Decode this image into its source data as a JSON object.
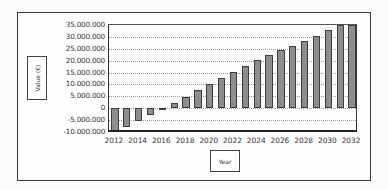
{
  "chart_data": {
    "type": "bar",
    "title": "",
    "xlabel": "Year",
    "ylabel": "Value (€)",
    "ylim": [
      -10000000,
      35000000
    ],
    "y_ticks": [
      "35.000.000",
      "30.000.000",
      "25.000.000",
      "20.000.000",
      "15.000.000",
      "10.000.000",
      "5.000.000",
      "0",
      "-5.000.000",
      "-10.000.000"
    ],
    "x_ticks": [
      "2012",
      "2014",
      "2016",
      "2018",
      "2020",
      "2022",
      "2024",
      "2026",
      "2028",
      "2030",
      "2032"
    ],
    "grid": true,
    "legend": null,
    "categories": [
      "2012",
      "2013",
      "2014",
      "2015",
      "2016",
      "2017",
      "2018",
      "2019",
      "2020",
      "2021",
      "2022",
      "2023",
      "2024",
      "2025",
      "2026",
      "2027",
      "2028",
      "2029",
      "2030",
      "2031",
      "2032"
    ],
    "values": [
      -10000000,
      -7800000,
      -5200000,
      -2800000,
      -300000,
      2100000,
      4800000,
      7600000,
      10200000,
      12800000,
      15300000,
      17800000,
      20300000,
      22400000,
      24300000,
      26300000,
      28400000,
      30500000,
      33000000,
      35000000,
      36000000
    ]
  },
  "colors": {
    "bar_fill": "#8d8d8d",
    "bar_border": "#3d3d3d",
    "grid": "#9a9a9a",
    "axis": "#222222"
  }
}
